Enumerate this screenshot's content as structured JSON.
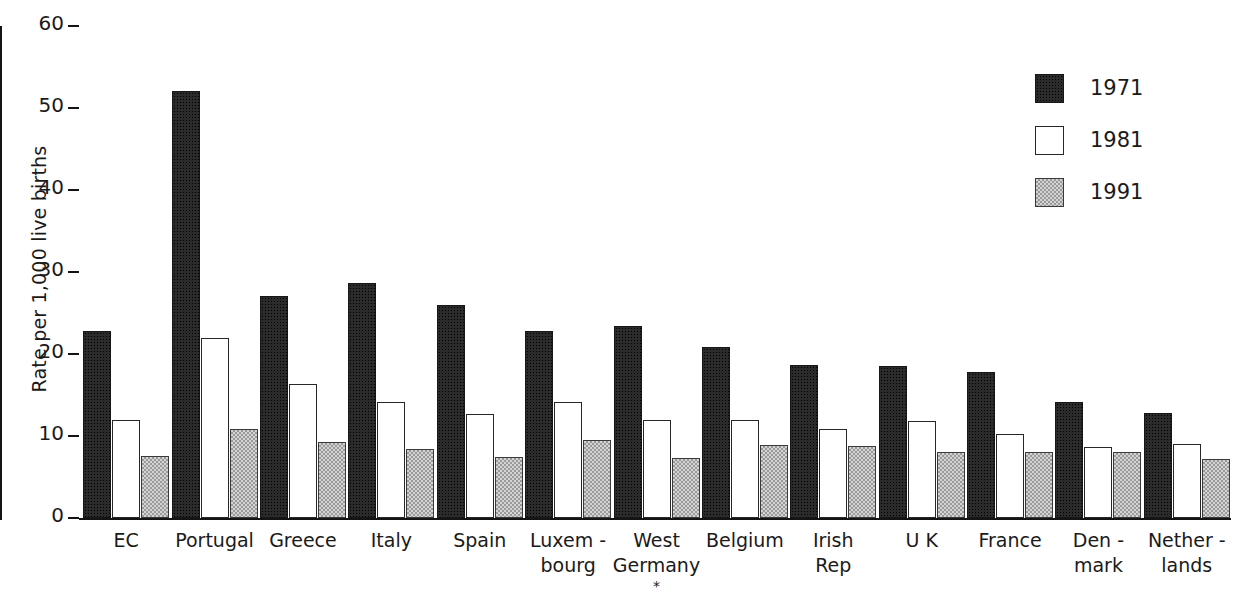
{
  "chart_data": {
    "type": "bar",
    "title": "",
    "subtitle": "",
    "xlabel": "",
    "ylabel": "Rate per 1,000 live births",
    "ylim": [
      0,
      60
    ],
    "yticks": [
      0,
      10,
      20,
      30,
      40,
      50,
      60
    ],
    "ytick_labels": [
      "0",
      "10",
      "20",
      "30",
      "40",
      "50",
      "60"
    ],
    "grid": false,
    "legend_position": "top-right",
    "categories": [
      "EC",
      "Portugal",
      "Greece",
      "Italy",
      "Spain",
      "Luxem -\nbourg",
      "West\nGermany",
      "Belgium",
      "Irish\nRep",
      "U K",
      "France",
      "Den -\nmark",
      "Nether -\nlands"
    ],
    "annotations": [
      {
        "text": "*",
        "attached_to": "West\nGermany"
      }
    ],
    "series": [
      {
        "name": "1971",
        "color": "#2b2b2b",
        "fill": "dark-stipple",
        "values": [
          22.8,
          52.1,
          27.1,
          28.7,
          26.0,
          22.8,
          23.4,
          20.9,
          18.6,
          18.5,
          17.8,
          14.2,
          12.8
        ]
      },
      {
        "name": "1981",
        "color": "#ffffff",
        "fill": "white-outline",
        "values": [
          12.0,
          21.9,
          16.4,
          14.2,
          12.7,
          14.1,
          12.0,
          12.0,
          10.8,
          11.8,
          10.3,
          8.6,
          9.0
        ]
      },
      {
        "name": "1991",
        "color": "#d4d4d4",
        "fill": "light-checker",
        "values": [
          7.6,
          10.9,
          9.3,
          8.4,
          7.5,
          9.5,
          7.3,
          8.9,
          8.8,
          8.1,
          8.0,
          8.1,
          7.2
        ]
      }
    ]
  },
  "legend": {
    "entries": [
      {
        "label": "1971"
      },
      {
        "label": "1981"
      },
      {
        "label": "1991"
      }
    ]
  }
}
